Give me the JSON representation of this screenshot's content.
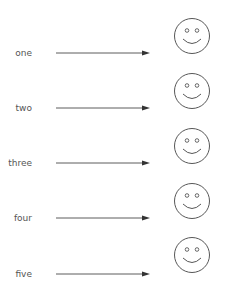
{
  "diagram": {
    "rows": [
      {
        "label": "one"
      },
      {
        "label": "two"
      },
      {
        "label": "three"
      },
      {
        "label": "four"
      },
      {
        "label": "five"
      }
    ],
    "connector": "arrow-right",
    "target_icon": "smiley-face-icon",
    "colors": {
      "text": "#555555",
      "line": "#333333"
    }
  }
}
